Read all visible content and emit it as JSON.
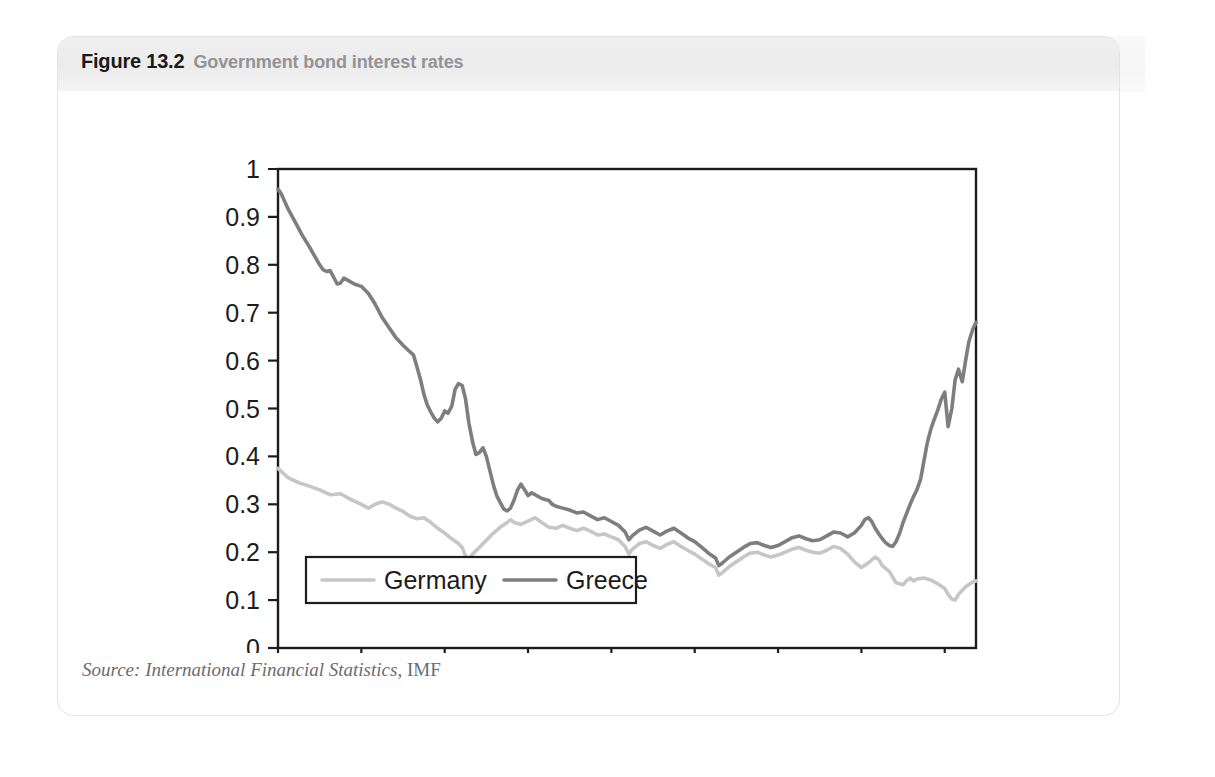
{
  "figure": {
    "number": "Figure 13.2",
    "caption": "Government bond interest rates",
    "source_italic": "Source: International Financial Statistics",
    "source_roman": ", IMF"
  },
  "ghost": {
    "text": "13.1 Reducing a budget deficit"
  },
  "colors": {
    "germany": "#c6c6c6",
    "greece": "#7e7e7e",
    "axis": "#1c1c1c",
    "header_band": "#ececed",
    "caption_gray": "#939397",
    "card_border": "#e3e3e3"
  },
  "chart_data": {
    "type": "line",
    "title": "Government bond interest rates",
    "xlabel": "",
    "ylabel": "",
    "ylim": [
      0,
      1
    ],
    "ytick_labels": [
      "0",
      "0.1",
      "0.2",
      "0.3",
      "0.4",
      "0.5",
      "0.6",
      "0.7",
      "0.8",
      "0.9",
      "1"
    ],
    "ytick_values": [
      0,
      0.1,
      0.2,
      0.3,
      0.4,
      0.5,
      0.6,
      0.7,
      0.8,
      0.9,
      1
    ],
    "xtick_labels": [
      "1995M1",
      "1997M1",
      "1999M1",
      "2001M1",
      "2003M1",
      "2005M1",
      "2007M1",
      "2009M1",
      "2011M1"
    ],
    "xtick_values": [
      1995,
      1997,
      1999,
      2001,
      2003,
      2005,
      2007,
      2009,
      2011
    ],
    "xlim": [
      1995,
      2011.75
    ],
    "grid": false,
    "legend_position": "bottom-left",
    "series": [
      {
        "name": "Germany",
        "color": "#c6c6c6",
        "values": [
          [
            1995.0,
            0.375
          ],
          [
            1995.25,
            0.355
          ],
          [
            1995.5,
            0.345
          ],
          [
            1995.75,
            0.338
          ],
          [
            1996.0,
            0.33
          ],
          [
            1996.25,
            0.32
          ],
          [
            1996.5,
            0.322
          ],
          [
            1996.75,
            0.31
          ],
          [
            1997.0,
            0.3
          ],
          [
            1997.17,
            0.292
          ],
          [
            1997.33,
            0.3
          ],
          [
            1997.5,
            0.305
          ],
          [
            1997.67,
            0.3
          ],
          [
            1997.83,
            0.292
          ],
          [
            1998.0,
            0.285
          ],
          [
            1998.17,
            0.275
          ],
          [
            1998.33,
            0.27
          ],
          [
            1998.5,
            0.272
          ],
          [
            1998.67,
            0.262
          ],
          [
            1998.83,
            0.25
          ],
          [
            1999.0,
            0.24
          ],
          [
            1999.17,
            0.228
          ],
          [
            1999.33,
            0.218
          ],
          [
            1999.42,
            0.21
          ],
          [
            1999.5,
            0.192
          ],
          [
            1999.58,
            0.186
          ],
          [
            1999.67,
            0.196
          ],
          [
            1999.83,
            0.21
          ],
          [
            2000.0,
            0.225
          ],
          [
            2000.17,
            0.24
          ],
          [
            2000.33,
            0.252
          ],
          [
            2000.5,
            0.262
          ],
          [
            2000.58,
            0.268
          ],
          [
            2000.67,
            0.262
          ],
          [
            2000.83,
            0.258
          ],
          [
            2001.0,
            0.265
          ],
          [
            2001.17,
            0.272
          ],
          [
            2001.33,
            0.262
          ],
          [
            2001.5,
            0.252
          ],
          [
            2001.67,
            0.25
          ],
          [
            2001.83,
            0.256
          ],
          [
            2002.0,
            0.25
          ],
          [
            2002.17,
            0.245
          ],
          [
            2002.33,
            0.25
          ],
          [
            2002.5,
            0.244
          ],
          [
            2002.67,
            0.236
          ],
          [
            2002.83,
            0.238
          ],
          [
            2003.0,
            0.232
          ],
          [
            2003.17,
            0.226
          ],
          [
            2003.33,
            0.212
          ],
          [
            2003.42,
            0.196
          ],
          [
            2003.5,
            0.206
          ],
          [
            2003.67,
            0.218
          ],
          [
            2003.83,
            0.222
          ],
          [
            2004.0,
            0.214
          ],
          [
            2004.17,
            0.208
          ],
          [
            2004.33,
            0.216
          ],
          [
            2004.5,
            0.222
          ],
          [
            2004.67,
            0.212
          ],
          [
            2004.83,
            0.204
          ],
          [
            2005.0,
            0.196
          ],
          [
            2005.17,
            0.186
          ],
          [
            2005.33,
            0.176
          ],
          [
            2005.5,
            0.168
          ],
          [
            2005.58,
            0.152
          ],
          [
            2005.67,
            0.158
          ],
          [
            2005.83,
            0.17
          ],
          [
            2006.0,
            0.18
          ],
          [
            2006.17,
            0.19
          ],
          [
            2006.33,
            0.198
          ],
          [
            2006.5,
            0.2
          ],
          [
            2006.67,
            0.194
          ],
          [
            2006.83,
            0.19
          ],
          [
            2007.0,
            0.194
          ],
          [
            2007.17,
            0.2
          ],
          [
            2007.33,
            0.206
          ],
          [
            2007.5,
            0.21
          ],
          [
            2007.67,
            0.204
          ],
          [
            2007.83,
            0.2
          ],
          [
            2008.0,
            0.198
          ],
          [
            2008.17,
            0.204
          ],
          [
            2008.33,
            0.212
          ],
          [
            2008.5,
            0.208
          ],
          [
            2008.67,
            0.196
          ],
          [
            2008.83,
            0.18
          ],
          [
            2009.0,
            0.168
          ],
          [
            2009.17,
            0.178
          ],
          [
            2009.33,
            0.19
          ],
          [
            2009.42,
            0.184
          ],
          [
            2009.5,
            0.172
          ],
          [
            2009.67,
            0.16
          ],
          [
            2009.75,
            0.148
          ],
          [
            2009.83,
            0.136
          ],
          [
            2010.0,
            0.132
          ],
          [
            2010.08,
            0.14
          ],
          [
            2010.17,
            0.146
          ],
          [
            2010.25,
            0.14
          ],
          [
            2010.33,
            0.144
          ],
          [
            2010.5,
            0.146
          ],
          [
            2010.67,
            0.142
          ],
          [
            2010.83,
            0.134
          ],
          [
            2011.0,
            0.124
          ],
          [
            2011.08,
            0.112
          ],
          [
            2011.17,
            0.102
          ],
          [
            2011.25,
            0.1
          ],
          [
            2011.33,
            0.112
          ],
          [
            2011.5,
            0.128
          ],
          [
            2011.67,
            0.138
          ],
          [
            2011.75,
            0.14
          ]
        ]
      },
      {
        "name": "Greece",
        "color": "#7e7e7e",
        "values": [
          [
            1995.0,
            0.958
          ],
          [
            1995.08,
            0.948
          ],
          [
            1995.25,
            0.915
          ],
          [
            1995.42,
            0.888
          ],
          [
            1995.58,
            0.862
          ],
          [
            1995.75,
            0.838
          ],
          [
            1995.92,
            0.812
          ],
          [
            1996.0,
            0.8
          ],
          [
            1996.08,
            0.79
          ],
          [
            1996.17,
            0.786
          ],
          [
            1996.25,
            0.788
          ],
          [
            1996.33,
            0.775
          ],
          [
            1996.42,
            0.76
          ],
          [
            1996.5,
            0.762
          ],
          [
            1996.58,
            0.772
          ],
          [
            1996.67,
            0.768
          ],
          [
            1996.83,
            0.76
          ],
          [
            1997.0,
            0.755
          ],
          [
            1997.17,
            0.74
          ],
          [
            1997.33,
            0.718
          ],
          [
            1997.5,
            0.69
          ],
          [
            1997.67,
            0.668
          ],
          [
            1997.83,
            0.648
          ],
          [
            1998.0,
            0.632
          ],
          [
            1998.17,
            0.618
          ],
          [
            1998.25,
            0.612
          ],
          [
            1998.33,
            0.588
          ],
          [
            1998.42,
            0.56
          ],
          [
            1998.5,
            0.53
          ],
          [
            1998.58,
            0.508
          ],
          [
            1998.67,
            0.492
          ],
          [
            1998.75,
            0.48
          ],
          [
            1998.83,
            0.472
          ],
          [
            1998.92,
            0.48
          ],
          [
            1999.0,
            0.495
          ],
          [
            1999.08,
            0.49
          ],
          [
            1999.17,
            0.505
          ],
          [
            1999.25,
            0.54
          ],
          [
            1999.33,
            0.552
          ],
          [
            1999.42,
            0.548
          ],
          [
            1999.5,
            0.52
          ],
          [
            1999.58,
            0.47
          ],
          [
            1999.67,
            0.43
          ],
          [
            1999.75,
            0.404
          ],
          [
            1999.83,
            0.408
          ],
          [
            1999.92,
            0.418
          ],
          [
            2000.0,
            0.4
          ],
          [
            2000.08,
            0.372
          ],
          [
            2000.17,
            0.34
          ],
          [
            2000.25,
            0.318
          ],
          [
            2000.33,
            0.304
          ],
          [
            2000.42,
            0.29
          ],
          [
            2000.5,
            0.286
          ],
          [
            2000.58,
            0.292
          ],
          [
            2000.67,
            0.31
          ],
          [
            2000.75,
            0.33
          ],
          [
            2000.83,
            0.342
          ],
          [
            2000.92,
            0.33
          ],
          [
            2001.0,
            0.318
          ],
          [
            2001.08,
            0.324
          ],
          [
            2001.17,
            0.32
          ],
          [
            2001.33,
            0.312
          ],
          [
            2001.5,
            0.308
          ],
          [
            2001.58,
            0.3
          ],
          [
            2001.67,
            0.296
          ],
          [
            2001.83,
            0.292
          ],
          [
            2002.0,
            0.288
          ],
          [
            2002.17,
            0.282
          ],
          [
            2002.33,
            0.284
          ],
          [
            2002.5,
            0.276
          ],
          [
            2002.67,
            0.268
          ],
          [
            2002.83,
            0.272
          ],
          [
            2003.0,
            0.264
          ],
          [
            2003.17,
            0.256
          ],
          [
            2003.33,
            0.242
          ],
          [
            2003.42,
            0.226
          ],
          [
            2003.5,
            0.234
          ],
          [
            2003.67,
            0.246
          ],
          [
            2003.83,
            0.252
          ],
          [
            2004.0,
            0.244
          ],
          [
            2004.17,
            0.236
          ],
          [
            2004.33,
            0.244
          ],
          [
            2004.5,
            0.25
          ],
          [
            2004.67,
            0.24
          ],
          [
            2004.83,
            0.23
          ],
          [
            2005.0,
            0.222
          ],
          [
            2005.17,
            0.21
          ],
          [
            2005.33,
            0.198
          ],
          [
            2005.5,
            0.188
          ],
          [
            2005.58,
            0.172
          ],
          [
            2005.67,
            0.178
          ],
          [
            2005.83,
            0.19
          ],
          [
            2006.0,
            0.2
          ],
          [
            2006.17,
            0.21
          ],
          [
            2006.33,
            0.218
          ],
          [
            2006.5,
            0.22
          ],
          [
            2006.67,
            0.214
          ],
          [
            2006.83,
            0.21
          ],
          [
            2007.0,
            0.214
          ],
          [
            2007.17,
            0.222
          ],
          [
            2007.33,
            0.23
          ],
          [
            2007.5,
            0.234
          ],
          [
            2007.67,
            0.228
          ],
          [
            2007.83,
            0.224
          ],
          [
            2008.0,
            0.226
          ],
          [
            2008.17,
            0.234
          ],
          [
            2008.33,
            0.242
          ],
          [
            2008.5,
            0.24
          ],
          [
            2008.67,
            0.232
          ],
          [
            2008.83,
            0.24
          ],
          [
            2009.0,
            0.256
          ],
          [
            2009.08,
            0.268
          ],
          [
            2009.17,
            0.272
          ],
          [
            2009.25,
            0.264
          ],
          [
            2009.33,
            0.25
          ],
          [
            2009.42,
            0.238
          ],
          [
            2009.5,
            0.228
          ],
          [
            2009.58,
            0.22
          ],
          [
            2009.67,
            0.214
          ],
          [
            2009.75,
            0.212
          ],
          [
            2009.83,
            0.222
          ],
          [
            2009.92,
            0.24
          ],
          [
            2010.0,
            0.262
          ],
          [
            2010.08,
            0.28
          ],
          [
            2010.17,
            0.3
          ],
          [
            2010.25,
            0.316
          ],
          [
            2010.33,
            0.33
          ],
          [
            2010.42,
            0.352
          ],
          [
            2010.5,
            0.39
          ],
          [
            2010.58,
            0.428
          ],
          [
            2010.67,
            0.458
          ],
          [
            2010.75,
            0.478
          ],
          [
            2010.83,
            0.496
          ],
          [
            2010.92,
            0.52
          ],
          [
            2011.0,
            0.534
          ],
          [
            2011.08,
            0.462
          ],
          [
            2011.17,
            0.5
          ],
          [
            2011.25,
            0.56
          ],
          [
            2011.33,
            0.582
          ],
          [
            2011.42,
            0.556
          ],
          [
            2011.5,
            0.6
          ],
          [
            2011.58,
            0.64
          ],
          [
            2011.67,
            0.665
          ],
          [
            2011.75,
            0.68
          ]
        ]
      }
    ]
  }
}
